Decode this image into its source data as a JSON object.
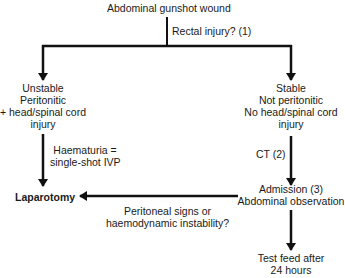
{
  "diagram": {
    "root": "Abdominal gunshot wound",
    "root_question": "Rectal injury? (1)",
    "left_branch": {
      "lines": [
        "Unstable",
        "Peritonitic",
        "+ head/spinal cord",
        "injury"
      ],
      "edge_label": [
        "Haematuria =",
        "single-shot IVP"
      ]
    },
    "right_branch": {
      "lines": [
        "Stable",
        "Not peritonitic",
        "No head/spinal cord",
        "injury"
      ],
      "edge_label": "CT (2)"
    },
    "laparotomy": "Laparotomy",
    "admission": [
      "Admission (3)",
      "Abdominal observation"
    ],
    "admission_to_laparotomy_label": [
      "Peritoneal signs or",
      "haemodynamic instability?"
    ],
    "test_feed": [
      "Test feed after",
      "24 hours"
    ]
  },
  "colors": {
    "line": "#111111",
    "text": "#1a1a1a",
    "background": "#ffffff"
  }
}
